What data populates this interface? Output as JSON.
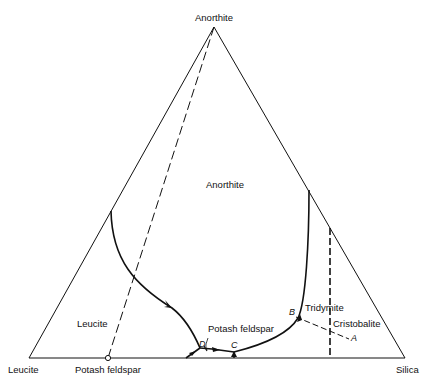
{
  "diagram": {
    "type": "ternary-phase-diagram",
    "vertices": {
      "top": "Anorthite",
      "bottom_left": "Leucite",
      "bottom_right": "Silica"
    },
    "base_point_label": "Potash feldspar",
    "fields": {
      "anorthite": "Anorthite",
      "leucite": "Leucite",
      "tridymite": "Tridymite",
      "cristobalite": "Cristobalite",
      "potash_feldspar": "Potash feldspar"
    },
    "points": {
      "A": "A",
      "B": "B",
      "C": "C",
      "D": "D"
    }
  }
}
